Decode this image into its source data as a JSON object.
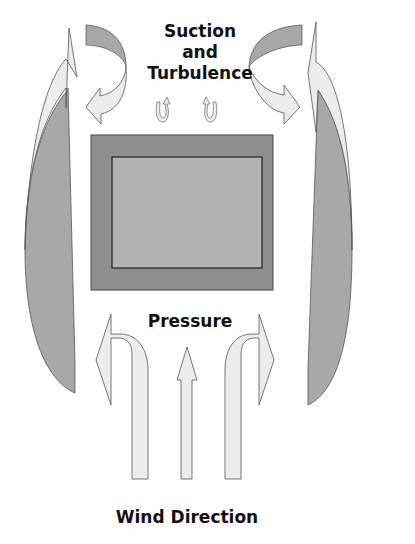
{
  "diagram": {
    "labels": {
      "suction_line1": "Suction",
      "suction_line2": "and",
      "suction_line3": "Turbulence",
      "pressure": "Pressure",
      "wind_direction": "Wind Direction"
    },
    "colors": {
      "building_outer": "#8e8e8e",
      "building_inner": "#b2b2b2",
      "arrow_light": "#ececec",
      "arrow_dark": "#a8a8a8",
      "stroke": "#555555"
    }
  }
}
